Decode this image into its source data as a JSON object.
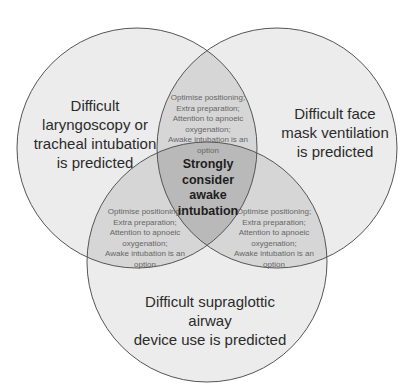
{
  "diagram": {
    "type": "venn-3",
    "circles": [
      {
        "id": "left",
        "cx": 137,
        "cy": 148,
        "r": 120,
        "label": "Difficult laryngoscopy or tracheal intubation is predicted",
        "lines": [
          "Difficult",
          "laryngoscopy or",
          "tracheal intubation",
          "is predicted"
        ]
      },
      {
        "id": "right",
        "cx": 277,
        "cy": 148,
        "r": 120,
        "label": "Difficult face mask ventilation is predicted",
        "lines": [
          "Difficult face",
          "mask ventilation",
          "is predicted"
        ]
      },
      {
        "id": "bottom",
        "cx": 207,
        "cy": 262,
        "r": 120,
        "label": "Difficult supraglottic airway device use is predicted",
        "lines": [
          "Difficult supraglottic airway",
          "device use is predicted"
        ]
      }
    ],
    "pairwise_overlap_text": [
      "Optimise positioning;",
      "Extra preparation;",
      "Attention to apnoeic",
      "oxygenation;",
      "Awake intubation is an",
      "option"
    ],
    "overlaps": {
      "top": {
        "lines": [
          "Optimise positioning;",
          "Extra preparation;",
          "Attention to apnoeic",
          "oxygenation;",
          "Awake intubation is an",
          "option"
        ]
      },
      "lower_left": {
        "lines": [
          "Optimise positioning;",
          "Extra preparation;",
          "Attention to apnoeic",
          "oxygenation;",
          "Awake intubation is an",
          "option"
        ]
      },
      "lower_right": {
        "lines": [
          "Optimise positioning;",
          "Extra preparation;",
          "Attention to apnoeic",
          "oxygenation;",
          "Awake intubation is an",
          "option"
        ]
      },
      "center": {
        "lines": [
          "Strongly",
          "consider",
          "awake",
          "intubation"
        ]
      }
    },
    "colors": {
      "single": "#ececec",
      "double": "#d6d6d6",
      "triple": "#b9b9b9",
      "stroke": "#555555",
      "background": "#ffffff"
    }
  }
}
